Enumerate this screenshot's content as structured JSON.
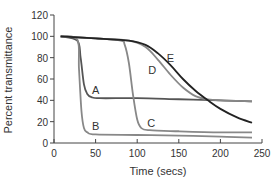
{
  "chart_data": {
    "type": "line",
    "title": "",
    "xlabel": "Time (secs)",
    "ylabel": "Percent transmittance",
    "xlim": [
      0,
      250
    ],
    "ylim": [
      0,
      120
    ],
    "xticks": [
      0,
      50,
      100,
      150,
      200,
      250
    ],
    "yticks": [
      0,
      20,
      40,
      60,
      80,
      100,
      120
    ],
    "grid": false,
    "legend": "inline labels",
    "series": [
      {
        "name": "A",
        "color": "#555555",
        "x": [
          8,
          28,
          32,
          36,
          40,
          45,
          55,
          100,
          150,
          200,
          238
        ],
        "y": [
          100,
          96,
          80,
          55,
          46,
          43,
          42,
          42,
          41,
          40,
          39
        ]
      },
      {
        "name": "B",
        "color": "#888888",
        "x": [
          8,
          28,
          30,
          33,
          36,
          40,
          50,
          100,
          150,
          200,
          238
        ],
        "y": [
          100,
          97,
          70,
          30,
          14,
          10,
          8,
          7.5,
          7,
          6,
          5
        ]
      },
      {
        "name": "C",
        "color": "#888888",
        "x": [
          8,
          50,
          80,
          85,
          90,
          95,
          100,
          105,
          115,
          150,
          200,
          238
        ],
        "y": [
          100,
          98,
          96,
          92,
          75,
          45,
          22,
          14,
          12,
          11,
          10,
          10
        ]
      },
      {
        "name": "D",
        "color": "#888888",
        "x": [
          8,
          50,
          90,
          110,
          125,
          140,
          155,
          170,
          185,
          200,
          238
        ],
        "y": [
          100,
          98,
          96,
          90,
          78,
          64,
          52,
          44,
          41,
          40,
          39
        ]
      },
      {
        "name": "E",
        "color": "#222222",
        "x": [
          8,
          50,
          90,
          110,
          125,
          140,
          155,
          170,
          185,
          200,
          220,
          238
        ],
        "y": [
          100,
          98,
          96,
          92,
          84,
          73,
          60,
          49,
          40,
          32,
          24,
          19
        ]
      }
    ],
    "annotations": [
      {
        "text": "A",
        "x": 50,
        "y": 46
      },
      {
        "text": "B",
        "x": 50,
        "y": 12
      },
      {
        "text": "C",
        "x": 117,
        "y": 15
      },
      {
        "text": "D",
        "x": 118,
        "y": 65
      },
      {
        "text": "E",
        "x": 140,
        "y": 76
      }
    ]
  }
}
